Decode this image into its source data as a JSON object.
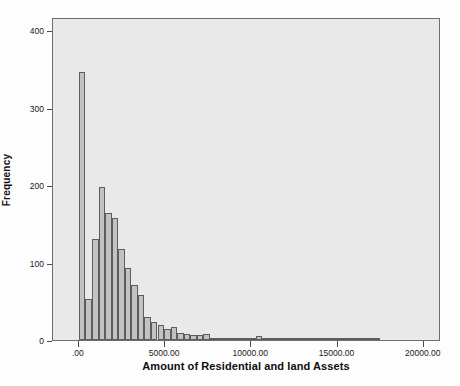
{
  "chart_data": {
    "type": "bar",
    "subtype": "histogram",
    "title": "",
    "xlabel": "Amount of Residential and land Assets",
    "ylabel": "Frequency",
    "xlim": [
      -1500,
      21000
    ],
    "ylim": [
      0,
      417
    ],
    "grid": false,
    "legend": null,
    "x_tick_labels": [
      ".00",
      "5000.00",
      "10000.00",
      "15000.00",
      "20000.00"
    ],
    "x_tick_values": [
      0,
      5000,
      10000,
      15000,
      20000
    ],
    "y_tick_labels": [
      "0",
      "100",
      "200",
      "300",
      "400"
    ],
    "y_tick_values": [
      0,
      100,
      200,
      300,
      400
    ],
    "bin_width": 380,
    "bin_starts": [
      0,
      380,
      760,
      1140,
      1520,
      1900,
      2280,
      2660,
      3040,
      3420,
      3800,
      4180,
      4560,
      4940,
      5320,
      5700,
      6080,
      6460,
      6840,
      7220,
      7600,
      7980,
      8360,
      8740,
      9120,
      9500,
      9880,
      10260,
      10640,
      11020,
      11400,
      11780,
      12160,
      12540,
      12920,
      13300,
      13680,
      14060,
      14440,
      14820,
      15200,
      15580,
      15960,
      16340,
      16720,
      17100
    ],
    "values": [
      346,
      53,
      130,
      197,
      164,
      157,
      117,
      93,
      71,
      58,
      30,
      23,
      20,
      14,
      17,
      9,
      8,
      7,
      7,
      8,
      2,
      2,
      2,
      1,
      2,
      3,
      1,
      5,
      2,
      1,
      1,
      1,
      1,
      1,
      2,
      1,
      1,
      1,
      1,
      1,
      1,
      1,
      1,
      1,
      1,
      2
    ],
    "categories": [
      "0",
      "380",
      "760",
      "1140",
      "1520",
      "1900",
      "2280",
      "2660",
      "3040",
      "3420",
      "3800",
      "4180",
      "4560",
      "4940",
      "5320",
      "5700",
      "6080",
      "6460",
      "6840",
      "7220",
      "7600",
      "7980",
      "8360",
      "8740",
      "9120",
      "9500",
      "9880",
      "10260",
      "10640",
      "11020",
      "11400",
      "11780",
      "12160",
      "12540",
      "12920",
      "13300",
      "13680",
      "14060",
      "14440",
      "14820",
      "15200",
      "15580",
      "15960",
      "16340",
      "16720",
      "17100"
    ],
    "colors": {
      "bar_fill": "#c2c2c2",
      "bar_edge": "#5d5d5d",
      "plot_background": "#e9e9e9",
      "frame": "#6e6e6e",
      "text": "#111111",
      "page_background": "#fdfdfd"
    }
  }
}
